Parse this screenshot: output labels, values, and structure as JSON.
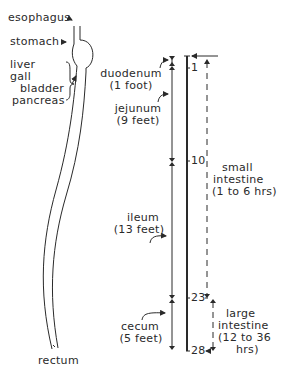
{
  "labels": {
    "esophagus": "esophagus",
    "stomach": "stomach",
    "liver": "liver",
    "gall": "gall",
    "bladder": "bladder",
    "pancreas": "pancreas",
    "rectum": "rectum",
    "duodenum": "duodenum",
    "duodenum_len": "(1 foot)",
    "jejunum": "jejunum",
    "jejunum_len": "(9 feet)",
    "ileum": "ileum",
    "ileum_len": "(13 feet)",
    "cecum": "cecum",
    "cecum_len": "(5 feet)",
    "small_l1": "small",
    "small_l2": "intestine",
    "small_l3": "(1 to 6 hrs)",
    "large_l1": "large",
    "large_l2": "intestine",
    "large_l3": "(12 to 36",
    "large_l4": "hrs)"
  },
  "scale": {
    "ticks": [
      "1",
      "10",
      "23",
      "28"
    ],
    "unit": "feet"
  },
  "colors": {
    "ink": "#2a2a2a",
    "background": "#ffffff"
  }
}
